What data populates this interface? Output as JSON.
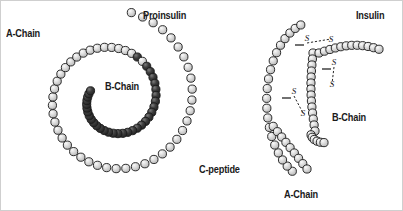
{
  "figure": {
    "background_color": "#ffffff",
    "border_color": "#cfcfcf",
    "width": 403,
    "height": 211
  },
  "labels": {
    "proinsulin": "Proinsulin",
    "a_chain_left": "A-Chain",
    "b_chain_left": "B-Chain",
    "c_peptide": "C-peptide",
    "insulin": "Insulin",
    "b_chain_right": "B-Chain",
    "a_chain_right": "A-Chain",
    "sulfur": "S"
  },
  "colors": {
    "bead_light_fill": "#d4d4d4",
    "bead_light_highlight": "#f2f2f2",
    "bead_dark_fill": "#3a3a3a",
    "bead_dark_highlight": "#6e6e6e",
    "bead_outline": "#1a1a1a",
    "text": "#1a1a1a",
    "bond_line": "#111111"
  },
  "diagram": {
    "panels": [
      {
        "name": "proinsulin",
        "description": "Single continuous spiral polypeptide chain coiled counter-clockwise",
        "segments": [
          {
            "name": "a-chain",
            "shade": "light",
            "bead_count": 21
          },
          {
            "name": "b-chain",
            "shade": "light",
            "bead_count": 30
          },
          {
            "name": "c-peptide",
            "shade": "dark",
            "bead_count": 31
          }
        ]
      },
      {
        "name": "insulin",
        "description": "Two separate chains linked by disulfide bridges after C-peptide removal",
        "segments": [
          {
            "name": "a-chain",
            "shade": "light",
            "bead_count": 21
          },
          {
            "name": "b-chain",
            "shade": "light",
            "bead_count": 30
          }
        ],
        "disulfide_bridges": 3
      }
    ]
  },
  "chart_data": {
    "type": "diagram",
    "proinsulin_spiral": {
      "center": [
        112,
        98
      ],
      "turns": 1.85,
      "bead_radius": 4.1,
      "path_points": 82,
      "segment_breaks": [
        21,
        51
      ],
      "start_angle_deg": -78,
      "end_angle_deg": 560,
      "radius_start": 96,
      "radius_end": 26
    },
    "insulin_a_chain": {
      "description": "left arc curving down-right, light beads",
      "bead_radius": 4.1,
      "bead_count": 27
    },
    "insulin_b_chain": {
      "description": "right hook arc, light beads",
      "bead_radius": 4.1,
      "bead_count": 26
    },
    "disulfide_bonds": [
      {
        "label": "S",
        "from": [
          306,
          42
        ],
        "to": [
          330,
          38
        ]
      },
      {
        "label": "S",
        "from": [
          333,
          66
        ],
        "to": [
          331,
          83
        ]
      },
      {
        "label": "S",
        "from": [
          293,
          95
        ],
        "to": [
          302,
          112
        ]
      }
    ]
  }
}
